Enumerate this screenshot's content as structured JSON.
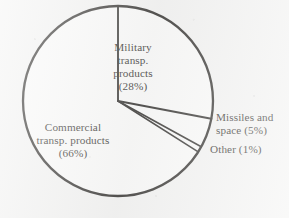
{
  "figure": {
    "caption": "",
    "background_color": "#f3f3f2",
    "ink_color": "#14120f"
  },
  "labels": {
    "military": "Military\ntransp.\nproducts\n(28%)",
    "commercial": "Commercial\ntransp. products\n(66%)",
    "missiles": "Missiles and\nspace (5%)",
    "other": "Other (1%)"
  },
  "chart_data": {
    "type": "pie",
    "title": "",
    "xlabel": "",
    "ylabel": "",
    "grid": false,
    "legend_position": "none",
    "start_angle_deg": 0,
    "direction": "clockwise",
    "center_px": [
      118,
      101
    ],
    "radius_px": 95,
    "categories": [
      "Military transp. products",
      "Missiles and space",
      "Other",
      "Commercial transp. products"
    ],
    "values": [
      28,
      5,
      1,
      66
    ],
    "unit": "percent",
    "slices": [
      {
        "label": "Military transp. products",
        "value": 28,
        "value_text": "(28%)",
        "start_deg": 0,
        "end_deg": 100.8,
        "fill": "none",
        "label_placement": "inside"
      },
      {
        "label": "Missiles and space",
        "value": 5,
        "value_text": "(5%)",
        "start_deg": 100.8,
        "end_deg": 118.8,
        "fill": "none",
        "label_placement": "outside-right"
      },
      {
        "label": "Other",
        "value": 1,
        "value_text": "(1%)",
        "start_deg": 118.8,
        "end_deg": 122.4,
        "fill": "none",
        "label_placement": "outside-right"
      },
      {
        "label": "Commercial transp. products",
        "value": 66,
        "value_text": "(66%)",
        "start_deg": 122.4,
        "end_deg": 360,
        "fill": "none",
        "label_placement": "inside"
      }
    ]
  }
}
